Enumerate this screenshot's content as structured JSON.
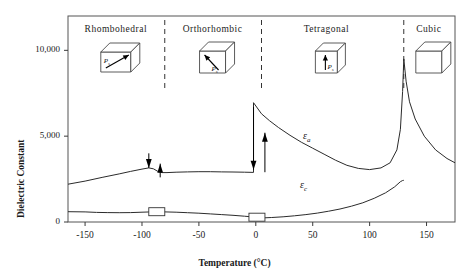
{
  "chart_data": {
    "type": "line",
    "title": "",
    "xlabel": "Temperature (°C)",
    "ylabel": "Dielectric Constant",
    "xlim": [
      -165,
      175
    ],
    "ylim": [
      0,
      12000
    ],
    "xticks": [
      -150,
      -100,
      -50,
      0,
      50,
      100,
      150
    ],
    "xticklabels": [
      "-150",
      "-100",
      "-50",
      "0",
      "50",
      "100",
      "150"
    ],
    "yticks": [
      0,
      5000,
      10000
    ],
    "yticklabels": [
      "0",
      "5,000",
      "10,000"
    ],
    "grid": false,
    "legend": "inline-curve-labels",
    "series": [
      {
        "name": "εa",
        "label": "ε",
        "label_sub": "a",
        "points": [
          [
            -165,
            2200
          ],
          [
            -150,
            2380
          ],
          [
            -135,
            2600
          ],
          [
            -120,
            2800
          ],
          [
            -110,
            2950
          ],
          [
            -100,
            3080
          ],
          [
            -94,
            3150
          ],
          [
            -90,
            3100
          ],
          [
            -86,
            2950
          ],
          [
            -82,
            2880
          ],
          [
            -78,
            2880
          ],
          [
            -70,
            2900
          ],
          [
            -60,
            2920
          ],
          [
            -50,
            2930
          ],
          [
            -40,
            2930
          ],
          [
            -30,
            2920
          ],
          [
            -20,
            2910
          ],
          [
            -10,
            2900
          ],
          [
            -2,
            2890
          ],
          [
            -2,
            6950
          ],
          [
            5,
            6300
          ],
          [
            12,
            5900
          ],
          [
            20,
            5500
          ],
          [
            30,
            5050
          ],
          [
            40,
            4650
          ],
          [
            50,
            4300
          ],
          [
            60,
            3950
          ],
          [
            70,
            3600
          ],
          [
            80,
            3300
          ],
          [
            90,
            3120
          ],
          [
            100,
            3050
          ],
          [
            110,
            3150
          ],
          [
            118,
            3450
          ],
          [
            124,
            4200
          ],
          [
            127,
            5400
          ],
          [
            129,
            7600
          ],
          [
            130,
            9500
          ],
          [
            132,
            8200
          ],
          [
            135,
            7000
          ],
          [
            140,
            6000
          ],
          [
            148,
            5000
          ],
          [
            158,
            4200
          ],
          [
            168,
            3700
          ],
          [
            175,
            3450
          ]
        ]
      },
      {
        "name": "εc",
        "label": "ε",
        "label_sub": "c",
        "points": [
          [
            -165,
            600
          ],
          [
            -150,
            590
          ],
          [
            -140,
            560
          ],
          [
            -130,
            545
          ],
          [
            -120,
            540
          ],
          [
            -110,
            550
          ],
          [
            -100,
            570
          ],
          [
            -92,
            590
          ],
          [
            -86,
            600
          ],
          [
            -80,
            590
          ],
          [
            -70,
            570
          ],
          [
            -60,
            540
          ],
          [
            -50,
            510
          ],
          [
            -40,
            470
          ],
          [
            -30,
            430
          ],
          [
            -20,
            390
          ],
          [
            -10,
            340
          ],
          [
            -4,
            300
          ],
          [
            -4,
            250
          ],
          [
            6,
            240
          ],
          [
            14,
            260
          ],
          [
            24,
            300
          ],
          [
            34,
            360
          ],
          [
            44,
            430
          ],
          [
            54,
            520
          ],
          [
            64,
            630
          ],
          [
            74,
            760
          ],
          [
            84,
            920
          ],
          [
            94,
            1120
          ],
          [
            104,
            1380
          ],
          [
            114,
            1700
          ],
          [
            122,
            2050
          ],
          [
            127,
            2350
          ],
          [
            129,
            2420
          ],
          [
            130,
            2430
          ]
        ]
      }
    ],
    "phase_boundaries": [
      {
        "temp": -80,
        "style": "dashed"
      },
      {
        "temp": 5,
        "style": "dashed"
      },
      {
        "temp": 130,
        "style": "dashed"
      }
    ],
    "annotations": [
      {
        "kind": "hysteresis-arrow",
        "temp": -94,
        "direction": "down",
        "from": 4000,
        "to": 3150
      },
      {
        "kind": "hysteresis-arrow",
        "temp": -84,
        "direction": "up",
        "from": 2600,
        "to": 3400
      },
      {
        "kind": "hysteresis-arrow",
        "temp": -2,
        "direction": "down",
        "from": 6700,
        "to": 3050
      },
      {
        "kind": "hysteresis-arrow",
        "temp": 8,
        "direction": "up",
        "from": 2900,
        "to": 5200
      },
      {
        "kind": "hysteresis-box",
        "temp": -87,
        "value": 600
      },
      {
        "kind": "hysteresis-box",
        "temp": 1,
        "value": 280
      }
    ]
  },
  "phases": [
    {
      "name": "Rhombohedral",
      "center_temp": -123,
      "crystal": "rhombohedral-cube",
      "ps_label": "P",
      "ps_sub": "s",
      "ps_direction": "body-diagonal"
    },
    {
      "name": "Orthorhombic",
      "center_temp": -38,
      "crystal": "orthorhombic-cube",
      "ps_label": "P",
      "ps_sub": "s",
      "ps_direction": "face-diagonal"
    },
    {
      "name": "Tetragonal",
      "center_temp": 62,
      "crystal": "tetragonal-cube",
      "ps_label": "P",
      "ps_sub": "s",
      "ps_direction": "vertical"
    },
    {
      "name": "Cubic",
      "center_temp": 152,
      "crystal": "cubic-cube",
      "ps_label": "",
      "ps_sub": "",
      "ps_direction": "none"
    }
  ],
  "colors": {
    "curve": "#2b2b2b",
    "axis": "#3a3a3a",
    "frame": "#555555",
    "text": "#1a1a1a",
    "arrow": "#000000"
  }
}
